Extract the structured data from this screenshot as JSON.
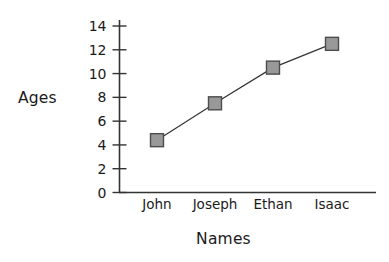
{
  "chart_data": {
    "type": "line",
    "title": "",
    "xlabel": "Names",
    "ylabel": "Ages",
    "categories": [
      "John",
      "Joseph",
      "Ethan",
      "Isaac"
    ],
    "values": [
      4.4,
      7.5,
      10.5,
      12.5
    ],
    "series": [
      {
        "name": "Ages",
        "values": [
          4.4,
          7.5,
          10.5,
          12.5
        ]
      }
    ],
    "ylim": [
      0,
      14
    ],
    "yticks": [
      0,
      2,
      4,
      6,
      8,
      10,
      12,
      14
    ],
    "ytick_labels": [
      "0",
      "2",
      "4",
      "6",
      "8",
      "10",
      "12",
      "14"
    ],
    "grid": false,
    "legend": false,
    "legend_position": "none",
    "marker": "square",
    "colors": {
      "marker_fill": "#999999",
      "marker_stroke": "#4d4d4d",
      "line": "#333333",
      "axis": "#333333",
      "text": "#1a1a1a",
      "background": "#ffffff"
    }
  }
}
